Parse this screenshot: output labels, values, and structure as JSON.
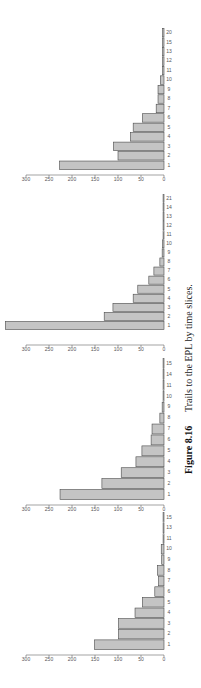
{
  "caption": {
    "label": "Figure 8.16",
    "text": "Trails to the EPL by time slices."
  },
  "chart_data": [
    {
      "type": "bar",
      "title": "",
      "xlabel": "",
      "ylabel": "",
      "ylim": [
        0,
        300
      ],
      "yticks": [
        0,
        50,
        100,
        150,
        200,
        250,
        300
      ],
      "categories": [
        "1",
        "2",
        "3",
        "4",
        "5",
        "6",
        "7",
        "8",
        "9",
        "10",
        "11",
        "13",
        "15"
      ],
      "values": [
        151,
        99,
        99,
        63,
        47,
        20,
        12,
        14,
        5,
        6,
        2,
        2,
        2
      ]
    },
    {
      "type": "bar",
      "title": "",
      "xlabel": "",
      "ylabel": "",
      "ylim": [
        0,
        300
      ],
      "yticks": [
        0,
        50,
        100,
        150,
        200,
        250,
        300
      ],
      "categories": [
        "1",
        "2",
        "3",
        "4",
        "5",
        "6",
        "7",
        "8",
        "9",
        "10",
        "11",
        "14",
        "15"
      ],
      "values": [
        226,
        135,
        93,
        61,
        48,
        28,
        26,
        9,
        4,
        2,
        2,
        2,
        2
      ]
    },
    {
      "type": "bar",
      "title": "",
      "xlabel": "",
      "ylabel": "",
      "ylim": [
        0,
        300
      ],
      "yticks": [
        0,
        50,
        100,
        150,
        200,
        250,
        300
      ],
      "categories": [
        "1",
        "2",
        "3",
        "4",
        "5",
        "6",
        "7",
        "8",
        "9",
        "10",
        "11",
        "12",
        "13",
        "14",
        "21"
      ],
      "values": [
        345,
        130,
        111,
        67,
        57,
        33,
        22,
        9,
        4,
        3,
        2,
        2,
        2,
        2,
        2
      ]
    },
    {
      "type": "bar",
      "title": "",
      "xlabel": "",
      "ylabel": "",
      "ylim": [
        0,
        300
      ],
      "yticks": [
        0,
        50,
        100,
        150,
        200,
        250,
        300
      ],
      "categories": [
        "1",
        "2",
        "3",
        "4",
        "5",
        "6",
        "7",
        "8",
        "9",
        "10",
        "11",
        "12",
        "13",
        "15",
        "20"
      ],
      "values": [
        227,
        100,
        110,
        73,
        67,
        47,
        17,
        13,
        13,
        8,
        3,
        3,
        3,
        3,
        3
      ]
    }
  ]
}
